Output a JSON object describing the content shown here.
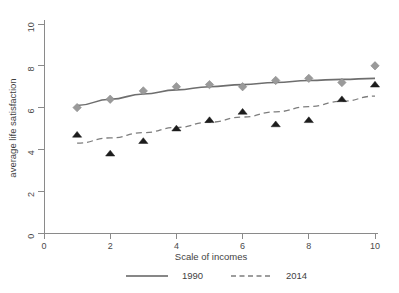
{
  "chart_data": {
    "type": "scatter",
    "title": "",
    "xlabel": "Scale of incomes",
    "ylabel": "average life satisfaction",
    "xlim": [
      0,
      10
    ],
    "ylim": [
      0,
      10
    ],
    "xticks": [
      0,
      2,
      4,
      6,
      8,
      10
    ],
    "yticks": [
      0,
      2,
      4,
      6,
      8,
      10
    ],
    "grid": false,
    "legend_position": "bottom",
    "x": [
      1,
      2,
      3,
      4,
      5,
      6,
      7,
      8,
      9,
      10
    ],
    "series": [
      {
        "name": "1990",
        "marker": "diamond",
        "color": "#9a9a9a",
        "line_style": "solid",
        "values": [
          6.0,
          6.4,
          6.8,
          7.0,
          7.1,
          7.0,
          7.3,
          7.4,
          7.2,
          8.0
        ],
        "fit": [
          6.1,
          6.4,
          6.65,
          6.85,
          7.0,
          7.1,
          7.2,
          7.3,
          7.35,
          7.4
        ]
      },
      {
        "name": "2014",
        "marker": "triangle",
        "color": "#1c1c1c",
        "line_style": "dashed",
        "values": [
          4.7,
          3.8,
          4.4,
          5.0,
          5.4,
          5.8,
          5.2,
          5.4,
          6.4,
          7.1
        ],
        "fit": [
          4.3,
          4.55,
          4.8,
          5.05,
          5.3,
          5.55,
          5.8,
          6.05,
          6.3,
          6.55
        ]
      }
    ]
  },
  "legend": {
    "entries": [
      {
        "label": "1990",
        "style": "solid"
      },
      {
        "label": "2014",
        "style": "dashed"
      }
    ]
  },
  "axis_labels": {
    "x_title": "Scale of incomes",
    "y_title": "average life satisfaction",
    "x_tick_labels": [
      "0",
      "2",
      "4",
      "6",
      "8",
      "10"
    ],
    "y_tick_labels": [
      "0",
      "2",
      "4",
      "6",
      "8",
      "10"
    ]
  }
}
